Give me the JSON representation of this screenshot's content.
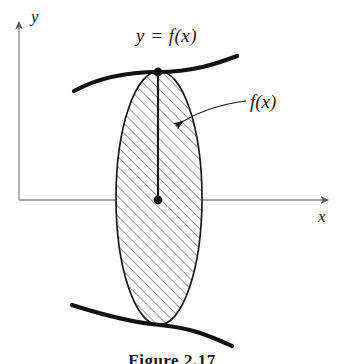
{
  "figure": {
    "kind": "math-diagram",
    "background_color": "#ffffff",
    "ink_color": "#1a1a1a",
    "axis_color": "#8a8a8a",
    "hatch_color": "#4a4a4a",
    "caption": "Figure 2.17",
    "labels": {
      "curve_equation": "y = f(x)",
      "region_callout": "f(x)",
      "axis_y": "y",
      "axis_x": "x"
    },
    "axes": {
      "origin": {
        "x": 19,
        "y": 200
      },
      "x_axis_end": {
        "x": 336,
        "y": 200
      },
      "y_axis_top": {
        "x": 19,
        "y": 14
      }
    },
    "ellipse": {
      "center_x": 159,
      "center_y": 198,
      "radius_x": 43,
      "radius_y": 127,
      "fill": "hatched-45deg",
      "hatch_spacing_px": 7
    },
    "points": [
      {
        "name": "point-on-curve",
        "x": 158,
        "y": 72
      },
      {
        "name": "point-on-axis",
        "x": 158,
        "y": 200
      }
    ],
    "segment": {
      "name": "ordinate-segment",
      "x": 158,
      "y_top": 72,
      "y_bottom": 200
    },
    "callout_arrow": {
      "tip": {
        "x": 166,
        "y": 128
      },
      "tail": {
        "x": 246,
        "y": 101
      }
    },
    "curve_upper": {
      "start": {
        "x": 74,
        "y": 91
      },
      "end": {
        "x": 237,
        "y": 56
      }
    },
    "curve_lower": {
      "start": {
        "x": 72,
        "y": 305
      },
      "end": {
        "x": 232,
        "y": 346
      }
    }
  }
}
